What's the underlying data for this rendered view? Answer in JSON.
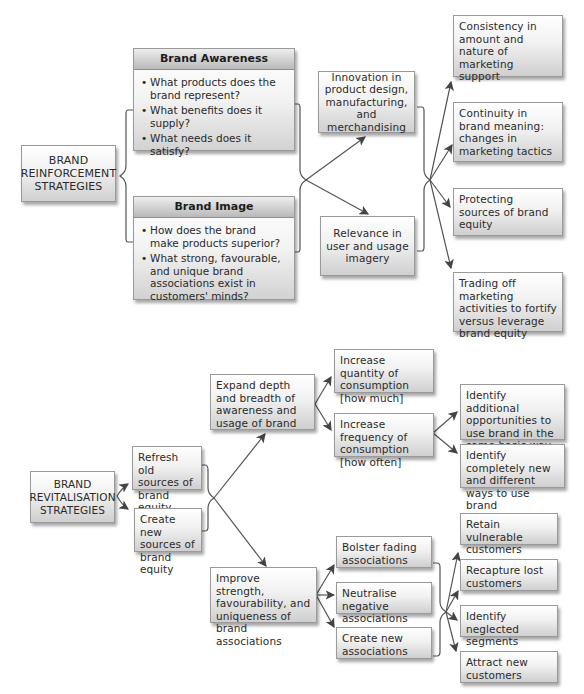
{
  "reinforcement": {
    "root": "BRAND\nREINFORCEMENT\nSTRATEGIES",
    "awareness": {
      "title": "Brand Awareness",
      "bullets": [
        "What products does the brand represent?",
        "What benefits does it supply?",
        "What needs does it satisfy?"
      ]
    },
    "image": {
      "title": "Brand Image",
      "bullets": [
        "How does the brand make products superior?",
        "What strong, favourable, and unique brand associations exist in customers' minds?"
      ]
    },
    "middle": [
      "Innovation in product design, manufacturing, and merchandising",
      "Relevance in user and usage imagery"
    ],
    "outcomes": [
      "Consistency in amount and nature of marketing support",
      "Continuity in brand meaning: changes in marketing tactics",
      "Protecting sources of brand equity",
      "Trading off marketing activities to fortify versus leverage brand equity"
    ]
  },
  "revitalisation": {
    "root": "BRAND\nREVITALISATION\nSTRATEGIES",
    "sources": [
      "Refresh old sources of brand equity",
      "Create new sources of brand equity"
    ],
    "expand": "Expand depth and breadth of awareness and usage of brand",
    "expand_children": [
      "Increase quantity of consumption [how much]",
      "Increase frequency of consumption [how often]"
    ],
    "frequency_children": [
      "Identify additional opportunities to use brand in the same basic way",
      "Identify completely new and different ways to use brand"
    ],
    "improve": "Improve strength, favourability, and uniqueness of brand associations",
    "improve_children": [
      "Bolster fading associations",
      "Neutralise negative associations",
      "Create new associations"
    ],
    "customer_outcomes": [
      "Retain vulnerable customers",
      "Recapture lost customers",
      "Identify neglected segments",
      "Attract new customers"
    ]
  },
  "colors": {
    "line": "#555555",
    "box_border": "#9a9a9a",
    "header_bg": "#c4c4c4"
  }
}
